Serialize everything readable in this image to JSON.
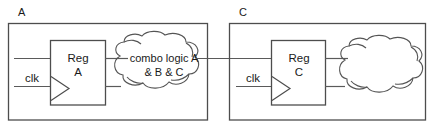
{
  "diagram": {
    "title_text": "",
    "colors": {
      "stroke": "#4d4d4d",
      "wire": "#5a5a5a",
      "cloud": "#555555",
      "background": "#ffffff",
      "text": "#1a1a1a"
    },
    "groups": [
      {
        "id": "group-a",
        "label": "A",
        "register": {
          "label_line1": "Reg",
          "label_line2": "A",
          "clock_label": "clk",
          "has_clock_triangle": true
        },
        "cloud": {
          "label_line1": "combo logic A",
          "label_line2": "& B & C",
          "has_label": true
        }
      },
      {
        "id": "group-c",
        "label": "C",
        "register": {
          "label_line1": "Reg",
          "label_line2": "C",
          "clock_label": "clk",
          "has_clock_triangle": true
        },
        "cloud": {
          "label_line1": "",
          "label_line2": "",
          "has_label": false
        }
      }
    ]
  }
}
